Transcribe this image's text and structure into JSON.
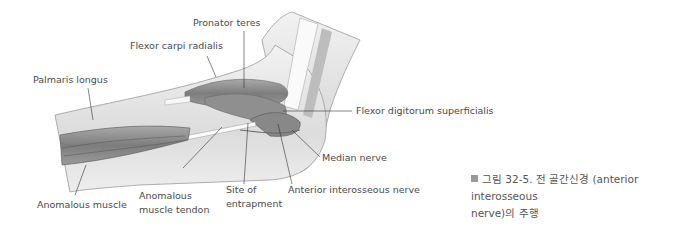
{
  "figure": {
    "labels": {
      "pronator_teres": "Pronator teres",
      "flexor_carpi_radialis": "Flexor carpi radialis",
      "palmaris_longus": "Palmaris longus",
      "flexor_digitorum_superficialis": "Flexor digitorum superficialis",
      "median_nerve": "Median nerve",
      "anterior_interosseous_nerve": "Anterior interosseous nerve",
      "site_of_entrapment_1": "Site of",
      "site_of_entrapment_2": "entrapment",
      "anomalous_muscle_tendon_1": "Anomalous",
      "anomalous_muscle_tendon_2": "muscle tendon",
      "anomalous_muscle": "Anomalous muscle"
    },
    "caption": {
      "line1": "그림 32-5. 전 골간신경 (anterior interosseous",
      "line2": "nerve)의 주행"
    },
    "colors": {
      "skin": "#e6e6e6",
      "muscle": "#8c8c8c",
      "tendon": "#f4f4f4",
      "leader": "#333333"
    }
  }
}
